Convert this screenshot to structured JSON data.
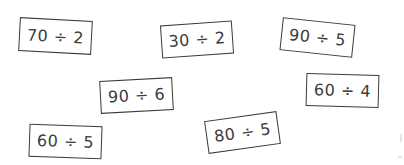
{
  "cards": [
    {
      "expression": "70 ÷ 2",
      "dividend": 70,
      "divisor": 2
    },
    {
      "expression": "30 ÷ 2",
      "dividend": 30,
      "divisor": 2
    },
    {
      "expression": "90 ÷ 5",
      "dividend": 90,
      "divisor": 5
    },
    {
      "expression": "90 ÷ 6",
      "dividend": 90,
      "divisor": 6
    },
    {
      "expression": "60 ÷ 4",
      "dividend": 60,
      "divisor": 4
    },
    {
      "expression": "60 ÷ 5",
      "dividend": 60,
      "divisor": 5
    },
    {
      "expression": "80 ÷ 5",
      "dividend": 80,
      "divisor": 5
    }
  ],
  "colors": {
    "background": "#ffffff",
    "border": "#3a3a3a",
    "text": "#3c3c3c"
  }
}
